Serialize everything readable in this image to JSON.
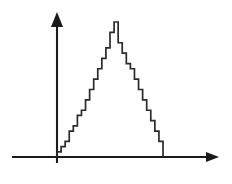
{
  "figure": {
    "title": "",
    "background_color": "#ffffff",
    "line_color": "#2b2b2b",
    "axis_color": "#1a1a1a",
    "y_axis_label": "",
    "x_axis_label": "",
    "y_axis_arrow": "arrow-up-icon",
    "x_axis_arrow": "arrow-right-icon"
  },
  "chart_data": {
    "type": "bar",
    "title": "",
    "subtitle": "",
    "xlabel": "",
    "ylabel": "",
    "grid": false,
    "legend": null,
    "annotations": [],
    "xlim": [
      0,
      27
    ],
    "ylim": [
      0,
      27
    ],
    "x_tick_labels": [],
    "y_tick_labels": [],
    "categories": [
      "1",
      "2",
      "3",
      "4",
      "5",
      "6",
      "7",
      "8",
      "9",
      "10",
      "11",
      "12",
      "13",
      "14",
      "15",
      "16",
      "17",
      "18",
      "19",
      "20",
      "21",
      "22",
      "23",
      "24",
      "25",
      "26"
    ],
    "values": [
      1,
      2,
      3,
      5,
      6,
      8,
      9,
      11,
      13,
      15,
      17,
      19,
      21,
      24,
      26,
      22,
      20,
      18,
      17,
      15,
      13,
      11,
      9,
      7,
      5,
      3
    ],
    "series": [
      {
        "name": "step-histogram",
        "values": [
          1,
          2,
          3,
          5,
          6,
          8,
          9,
          11,
          13,
          15,
          17,
          19,
          21,
          24,
          26,
          22,
          20,
          18,
          17,
          15,
          13,
          11,
          9,
          7,
          5,
          3
        ]
      }
    ]
  }
}
